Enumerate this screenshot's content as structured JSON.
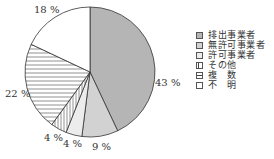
{
  "chart_data": {
    "type": "pie",
    "title": "",
    "start_angle": "12 o'clock",
    "direction": "clockwise",
    "categories": [
      "排出事業者",
      "無許可事業者",
      "許可事業者",
      "その他",
      "複　数",
      "不　明"
    ],
    "values": [
      43,
      9,
      4,
      4,
      22,
      18
    ],
    "value_labels": [
      "43 %",
      "9 %",
      "4 %",
      "4 %",
      "22 %",
      "18 %"
    ],
    "fills": [
      "#b5b5b5",
      "#d2d2d2",
      "#ececec",
      "vertical-stripes",
      "horizontal-stripes",
      "#ffffff"
    ],
    "legend_position": "right"
  },
  "legend": {
    "items": [
      {
        "label": "排出事業者",
        "fill": "#b5b5b5"
      },
      {
        "label": "無許可事業者",
        "fill": "#d2d2d2"
      },
      {
        "label": "許可事業者",
        "fill": "#ececec"
      },
      {
        "label": "その他",
        "fill": "vertical-stripes"
      },
      {
        "label": "複　数",
        "fill": "horizontal-stripes"
      },
      {
        "label": "不　明",
        "fill": "#ffffff"
      }
    ]
  },
  "labels": {
    "p43": "43 %",
    "p9": "9 %",
    "p4a": "4 %",
    "p4b": "4 %",
    "p22": "22 %",
    "p18": "18 %"
  }
}
